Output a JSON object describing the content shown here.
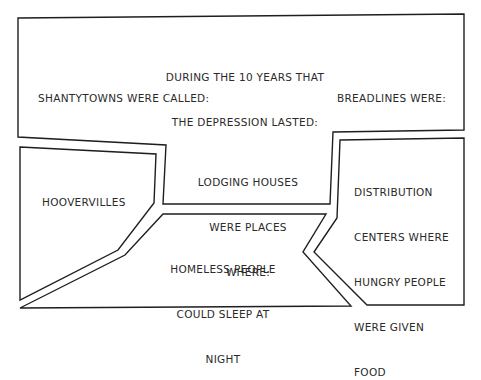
{
  "diagram": {
    "header": {
      "line1": "DURING THE 10 YEARS THAT",
      "line2": "THE DEPRESSION LASTED:"
    },
    "prompts": {
      "shantytowns": "SHANTYTOWNS WERE CALLED:",
      "breadlines": "BREADLINES WERE:",
      "lodging_line1": "LODGING HOUSES",
      "lodging_line2": "WERE PLACES",
      "lodging_line3": "WHERE:"
    },
    "answers": {
      "hoovervilles": "HOOVERVILLES",
      "homeless_line1": "HOMELESS PEOPLE",
      "homeless_line2": "COULD SLEEP AT",
      "homeless_line3": "NIGHT",
      "distribution_line1": "DISTRIBUTION",
      "distribution_line2": "CENTERS WHERE",
      "distribution_line3": "HUNGRY PEOPLE",
      "distribution_line4": "WERE GIVEN",
      "distribution_line5": "FOOD"
    },
    "colors": {
      "stroke": "#1e1e1e",
      "text": "#2a2a2a",
      "background": "#ffffff"
    }
  }
}
